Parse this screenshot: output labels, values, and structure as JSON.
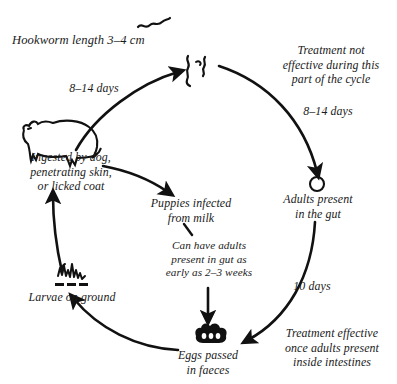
{
  "diagram": {
    "type": "cycle-diagram",
    "ink_color": "#111111",
    "background_color": "#ffffff"
  },
  "captions": {
    "hookworm_length": "Hookworm length 3–4 cm",
    "treatment_not_effective": "Treatment not\neffective during this\npart of the cycle",
    "treatment_effective": "Treatment effective\nonce adults present\ninside intestines",
    "early_adults_note": "Can have adults\npresent in gut as\nearly as 2–3 weeks"
  },
  "stages": [
    {
      "id": "worms-top",
      "label": "",
      "icon": "hookworm-icon"
    },
    {
      "id": "dog",
      "label": "Ingested by dog,\npenetrating skin,\nor licked coat",
      "icon": "dog-icon"
    },
    {
      "id": "puppies",
      "label": "Puppies infected\nfrom milk",
      "icon": ""
    },
    {
      "id": "adults-gut",
      "label": "Adults present\nin the gut",
      "icon": "circle-icon"
    },
    {
      "id": "eggs",
      "label": "Eggs passed\nin faeces",
      "icon": "eggs-icon"
    },
    {
      "id": "larvae",
      "label": "Larvae on ground",
      "icon": "larvae-icon"
    }
  ],
  "arrow_labels": {
    "dog_to_worms": "8–14 days",
    "worms_to_adults": "8–14 days",
    "adults_to_eggs": "10 days"
  }
}
